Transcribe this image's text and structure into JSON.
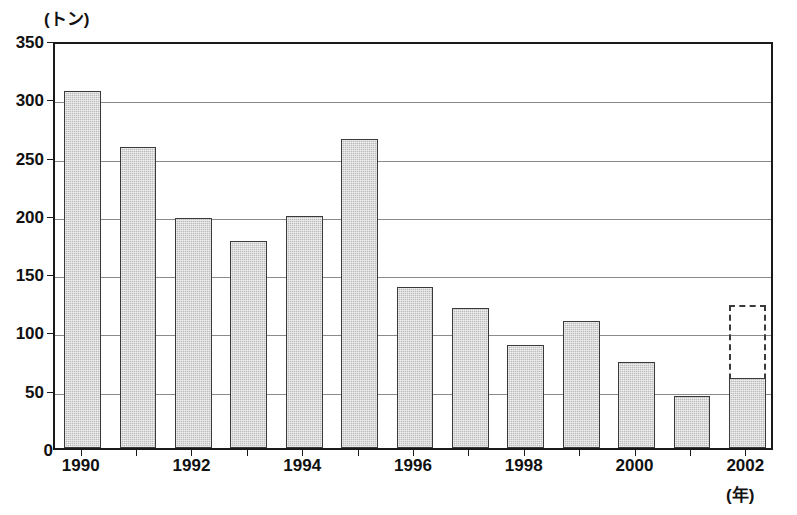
{
  "chart_data": {
    "type": "bar",
    "title": "",
    "subtitle": "",
    "xlabel": "(年)",
    "ylabel": "(トン)",
    "categories": [
      "1990",
      "1991",
      "1992",
      "1993",
      "1994",
      "1995",
      "1996",
      "1997",
      "1998",
      "1999",
      "2000",
      "2001",
      "2002"
    ],
    "values": [
      306,
      258,
      197,
      178,
      199,
      265,
      138,
      120,
      88,
      109,
      74,
      45,
      60
    ],
    "projection": {
      "category": "2002",
      "value": 123,
      "style": "dashed-outline",
      "note": "dashed outline above the 2002 solid bar"
    },
    "ylim": [
      0,
      350
    ],
    "ytick_values": [
      0,
      50,
      100,
      150,
      200,
      250,
      300,
      350
    ],
    "ytick_labels": [
      "0",
      "50",
      "100",
      "150",
      "200",
      "250",
      "300",
      "350"
    ],
    "xtick_labels": [
      "1990",
      "1992",
      "1994",
      "1996",
      "1998",
      "2000",
      "2002"
    ],
    "xtick_categories": [
      "1990",
      "1992",
      "1994",
      "1996",
      "1998",
      "2000",
      "2002"
    ],
    "grid": true,
    "grid_axis": "y",
    "legend": false,
    "legend_position": "none",
    "bar_fill_color": "#bcbcbc",
    "bar_edge_color": "#3a3a3a",
    "grid_color": "#8a8a8a",
    "axis_color": "#1a1a1a",
    "background_color": "#ffffff"
  }
}
